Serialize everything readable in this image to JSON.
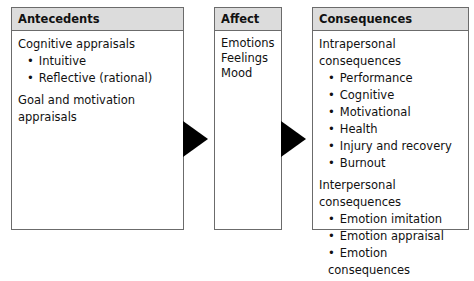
{
  "antecedents": {
    "title": "Antecedents",
    "groups": [
      {
        "label": "Cognitive appraisals",
        "items": [
          "Intuitive",
          "Reflective (rational)"
        ]
      },
      {
        "label": "Goal and motivation appraisals",
        "items": []
      }
    ]
  },
  "affect": {
    "title": "Affect",
    "items": [
      "Emotions",
      "Feelings",
      "Mood"
    ]
  },
  "consequences": {
    "title": "Consequences",
    "groups": [
      {
        "label": "Intrapersonal consequences",
        "items": [
          "Performance",
          "Cognitive",
          "Motivational",
          "Health",
          "Injury and recovery",
          "Burnout"
        ]
      },
      {
        "label": "Interpersonal consequences",
        "items": [
          "Emotion imitation",
          "Emotion appraisal",
          "Emotion consequences"
        ]
      }
    ]
  },
  "arrows": [
    {
      "from": "Antecedents",
      "to": "Affect",
      "color": "#000000"
    },
    {
      "from": "Affect",
      "to": "Consequences",
      "color": "#000000"
    }
  ]
}
